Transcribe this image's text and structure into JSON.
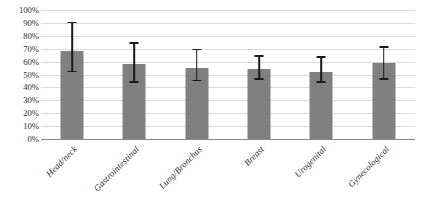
{
  "chart_data": {
    "type": "bar",
    "title": "",
    "subtitle": "",
    "xlabel": "",
    "ylabel": "",
    "categories": [
      "Head/neck",
      "Gastrointestinal",
      "Lung/Bronchus",
      "Breast",
      "Urogenital",
      "Gynecological"
    ],
    "values": [
      68,
      58,
      55,
      54,
      52,
      59
    ],
    "error_low": [
      53,
      45,
      46,
      47,
      45,
      47
    ],
    "error_high": [
      91,
      75,
      70,
      65,
      64,
      72
    ],
    "series": [
      {
        "name": "Percent",
        "values": [
          68,
          58,
          55,
          54,
          52,
          59
        ],
        "error_low": [
          53,
          45,
          46,
          47,
          45,
          47
        ],
        "error_high": [
          91,
          75,
          70,
          65,
          64,
          72
        ]
      }
    ],
    "ylim": [
      0,
      100
    ],
    "ytick_values": [
      0,
      10,
      20,
      30,
      40,
      50,
      60,
      70,
      80,
      90,
      100
    ],
    "ytick_labels": [
      "0%",
      "10%",
      "20%",
      "30%",
      "40%",
      "50%",
      "60%",
      "70%",
      "80%",
      "90%",
      "100%"
    ],
    "grid": true,
    "grid_axis": "y",
    "legend": false,
    "legend_position": "none",
    "error_bars": true,
    "bar_color": "#808080",
    "error_bar_color": "#1a1a1a",
    "gridline_color": "#d9d9d9",
    "axis_line_color": "#868686",
    "text_color": "#2b2b2b",
    "background_color": "#ffffff",
    "xtick_rotation": -45
  }
}
